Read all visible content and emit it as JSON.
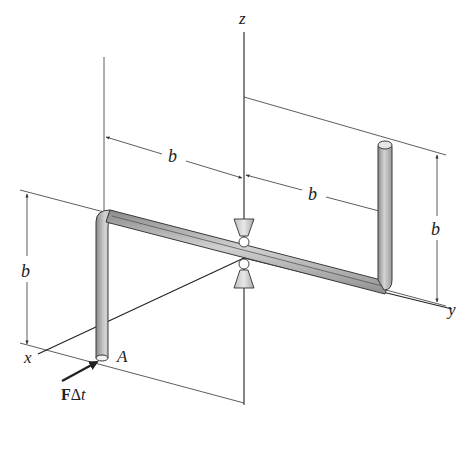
{
  "figure": {
    "type": "engineering-mechanics-diagram",
    "axes": {
      "x": "x",
      "y": "y",
      "z": "z"
    },
    "dimensions": {
      "upper_left_horizontal": "b",
      "upper_right_horizontal": "b",
      "left_vertical": "b",
      "right_vertical": "b"
    },
    "point_labels": {
      "end_point": "A"
    },
    "force": {
      "label_bold": "F",
      "label_rest": "Δt"
    },
    "colors": {
      "rod_fill": "#b8b8b8",
      "rod_edge": "#3a3a3a",
      "line": "#333333",
      "text": "#222222"
    }
  }
}
